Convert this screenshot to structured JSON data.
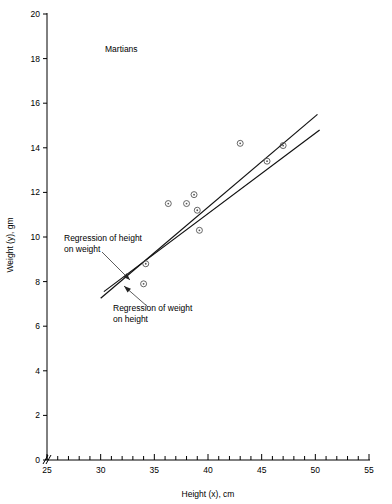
{
  "chart_data": {
    "type": "scatter",
    "title": "Martians",
    "xlabel": "Height (x), cm",
    "ylabel": "Weight (y), gm",
    "xlim": [
      25,
      55
    ],
    "ylim": [
      0,
      20
    ],
    "x_tick_labels": [
      "25",
      "30",
      "35",
      "40",
      "45",
      "50",
      "55"
    ],
    "x_ticks": [
      25,
      30,
      35,
      40,
      45,
      50,
      55
    ],
    "x_minor_step": 1,
    "y_tick_labels": [
      "0",
      "2",
      "4",
      "6",
      "8",
      "10",
      "12",
      "14",
      "16",
      "18",
      "20"
    ],
    "y_ticks": [
      0,
      2,
      4,
      6,
      8,
      10,
      12,
      14,
      16,
      18,
      20
    ],
    "grid": false,
    "legend": "none",
    "axis_break": true,
    "points": [
      {
        "x": 34.0,
        "y": 7.9
      },
      {
        "x": 34.2,
        "y": 8.8
      },
      {
        "x": 36.3,
        "y": 11.5
      },
      {
        "x": 38.0,
        "y": 11.5
      },
      {
        "x": 38.7,
        "y": 11.9
      },
      {
        "x": 39.0,
        "y": 11.2
      },
      {
        "x": 39.2,
        "y": 10.3
      },
      {
        "x": 43.0,
        "y": 14.2
      },
      {
        "x": 45.5,
        "y": 13.4
      },
      {
        "x": 47.0,
        "y": 14.1
      }
    ],
    "lines": [
      {
        "name": "Regression of height on weight",
        "x_start": 30.3,
        "y_start": 7.55,
        "x_end": 50.4,
        "y_end": 14.8
      },
      {
        "name": "Regression of weight on height",
        "x_start": 30.0,
        "y_start": 7.25,
        "x_end": 50.2,
        "y_end": 15.5
      }
    ],
    "annotations": [
      {
        "id": "annotation-height-on-weight",
        "text_line1": "Regression of height",
        "text_line2": "on weight",
        "text_x": 64,
        "text_y": 241,
        "arrow_from_x": 102,
        "arrow_from_y": 252,
        "arrow_to_x": 130,
        "arrow_to_y": 280
      },
      {
        "id": "annotation-weight-on-height",
        "text_line1": "Regression of weight",
        "text_line2": "on height",
        "text_x": 113,
        "text_y": 311,
        "arrow_from_x": 148,
        "arrow_from_y": 307,
        "arrow_to_x": 124,
        "arrow_to_y": 286
      }
    ]
  },
  "figure": {
    "title_x": 105,
    "title_y": 52
  }
}
